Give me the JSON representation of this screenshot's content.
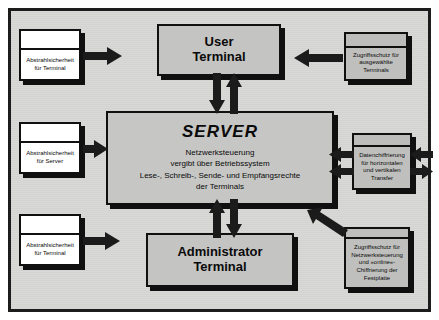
{
  "diagram": {
    "background_color": "#d8d8d6",
    "frame_color": "#1c1c1c",
    "node_fill": "#c6c6c4",
    "arrow_color": "#1b1b1b"
  },
  "nodes": {
    "user_terminal": {
      "line1": "User",
      "line2": "Terminal"
    },
    "admin_terminal": {
      "line1": "Administrator",
      "line2": "Terminal"
    },
    "server": {
      "title": "SERVER",
      "desc_line1": "Netzwerksteuerung",
      "desc_line2": "vergibt über Betriebssystem",
      "desc_line3": "Lese-, Schreib-, Sende- und Empfangsrechte",
      "desc_line4": "der Terminals"
    }
  },
  "left_boxes": [
    {
      "label": "Abstrahlsicherheit für Terminal"
    },
    {
      "label": "Abstrahlsicherheit für Server"
    },
    {
      "label": "Abstrahlsicherheit für Terminal"
    }
  ],
  "right_boxes": [
    {
      "label": "Zugriffsschutz für ausgewählte Terminals"
    },
    {
      "label": "Datenchiffrierung für horizontalen und vertikalen Transfer"
    },
    {
      "label": "Zugriffsschutz für Netzwerksteuerung und »online«-Chiffrierung der Festplatte"
    }
  ],
  "arrows": [
    {
      "name": "left-terminal-to-user-terminal",
      "direction": "right"
    },
    {
      "name": "left-server-to-server",
      "direction": "right"
    },
    {
      "name": "left-terminal-to-admin-terminal",
      "direction": "right"
    },
    {
      "name": "user-terminal-to-server-down",
      "direction": "down"
    },
    {
      "name": "server-to-user-terminal-up",
      "direction": "up"
    },
    {
      "name": "admin-terminal-to-server-up",
      "direction": "up"
    },
    {
      "name": "server-to-admin-terminal-down",
      "direction": "down"
    },
    {
      "name": "access-protection-to-user-terminal",
      "direction": "left"
    },
    {
      "name": "encryption-to-server-upper",
      "direction": "left"
    },
    {
      "name": "encryption-to-server-lower",
      "direction": "left"
    },
    {
      "name": "encryption-outward-upper",
      "direction": "left"
    },
    {
      "name": "encryption-outward-lower",
      "direction": "right"
    },
    {
      "name": "network-protection-to-server",
      "direction": "up-left"
    }
  ]
}
